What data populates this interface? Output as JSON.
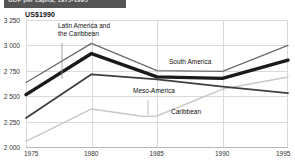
{
  "titlebar": {
    "text": "GDP per capita, 1975-1995"
  },
  "axis": {
    "ylabel": "US$1990",
    "yticks": [
      "3 250",
      "3 000",
      "2 750",
      "2 500",
      "2 250",
      "2 000"
    ],
    "xticks": [
      "1975",
      "1980",
      "1985",
      "1990",
      "1995"
    ]
  },
  "annotations": {
    "lac_line1": "Latin America and",
    "lac_line2": "the Caribbean",
    "south_america": "South America",
    "meso_america": "Meso-America",
    "caribbean": "Caribbean"
  },
  "colors": {
    "titlebar": "#555555",
    "grid": "#d9d9d9",
    "latin_america_and_caribbean": "#6b6b6b",
    "south_america": "#1a1a1a",
    "meso_america": "#3f3f3f",
    "caribbean": "#c8c8c8"
  },
  "chart_data": {
    "type": "line",
    "title": "GDP per capita, 1975-1995",
    "xlabel": "",
    "ylabel": "US$1990",
    "xlim": [
      1975,
      1995
    ],
    "ylim": [
      2000,
      3250
    ],
    "ytick_values": [
      3250,
      3000,
      2750,
      2500,
      2250,
      2000
    ],
    "xtick_values": [
      1975,
      1980,
      1985,
      1990,
      1995
    ],
    "grid": true,
    "legend": "inline-annotations",
    "x": [
      1975,
      1980,
      1985,
      1990,
      1995
    ],
    "series": [
      {
        "name": "Latin America and the Caribbean",
        "color": "#6b6b6b",
        "linewidth": 1.3,
        "values": [
          2635,
          3020,
          2752,
          2745,
          3000
        ]
      },
      {
        "name": "South America",
        "color": "#1a1a1a",
        "linewidth": 3.4,
        "values": [
          2515,
          2920,
          2690,
          2675,
          2855
        ]
      },
      {
        "name": "Meso-America",
        "color": "#3f3f3f",
        "linewidth": 1.8,
        "values": [
          2285,
          2715,
          2665,
          2595,
          2530
        ]
      },
      {
        "name": "Caribbean",
        "color": "#c8c8c8",
        "linewidth": 1.5,
        "x": [
          1975,
          1980,
          1984,
          1985,
          1990,
          1995
        ],
        "values": [
          2055,
          2375,
          2300,
          2305,
          2570,
          2690
        ]
      }
    ]
  }
}
